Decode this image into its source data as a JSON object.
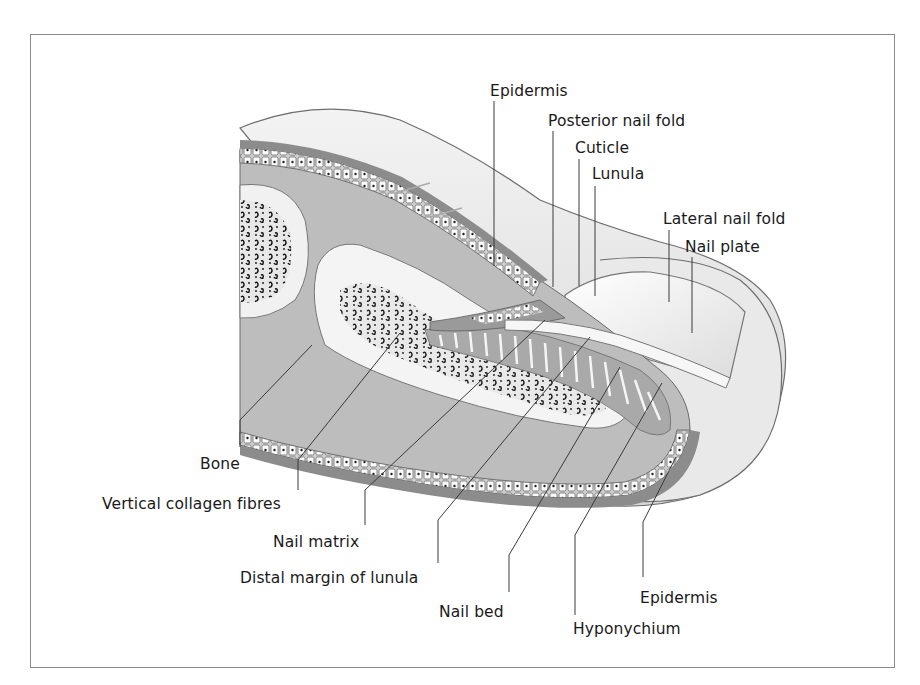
{
  "figure": {
    "frame_color": "#8a8a8a",
    "colors": {
      "dermis": "#b8b8b8",
      "epidermis_band": "#8c8c8c",
      "skin_surface": "#e6e6e6",
      "bone_marrow_spots": "#1a1a1a",
      "bone_cortex": "#f2f2f2",
      "nail_plate": "#f4f4f4",
      "leader_line": "#3a3a3a"
    }
  },
  "labels": {
    "top": [
      {
        "id": "epidermis-top",
        "text": "Epidermis"
      },
      {
        "id": "posterior-nail-fold",
        "text": "Posterior nail fold"
      },
      {
        "id": "cuticle",
        "text": "Cuticle"
      },
      {
        "id": "lunula",
        "text": "Lunula"
      },
      {
        "id": "lateral-nail-fold",
        "text": "Lateral nail fold"
      },
      {
        "id": "nail-plate",
        "text": "Nail plate"
      }
    ],
    "bottom": [
      {
        "id": "bone",
        "text": "Bone"
      },
      {
        "id": "vertical-collagen-fibres",
        "text": "Vertical collagen fibres"
      },
      {
        "id": "nail-matrix",
        "text": "Nail matrix"
      },
      {
        "id": "distal-margin-of-lunula",
        "text": "Distal margin of lunula"
      },
      {
        "id": "nail-bed",
        "text": "Nail bed"
      },
      {
        "id": "hyponychium",
        "text": "Hyponychium"
      },
      {
        "id": "epidermis-bottom",
        "text": "Epidermis"
      }
    ]
  }
}
